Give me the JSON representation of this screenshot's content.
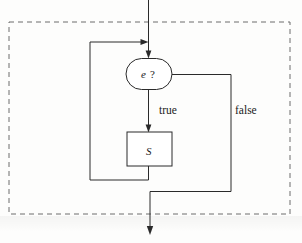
{
  "figure": {
    "kind": "control-flow-graph",
    "caption": "",
    "background_color": "#fdfdfc",
    "line_color": "#2a2a2a",
    "dashed_color": "#6d6d6d"
  },
  "nodes": {
    "condition": {
      "label_expr": "e",
      "label_suffix": "?",
      "shape": "stadium"
    },
    "body": {
      "label": "S",
      "shape": "rectangle"
    }
  },
  "edges": {
    "true_label": "true",
    "false_label": "false"
  },
  "region": {
    "label": "",
    "style": "dashed"
  }
}
